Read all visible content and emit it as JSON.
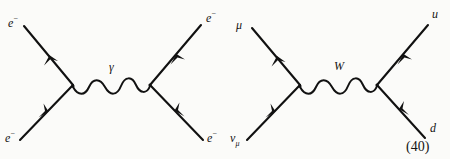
{
  "figure": {
    "caption_number": "(40)",
    "background_color": "#fbfbf9",
    "ink_color": "#111111",
    "width": 450,
    "height": 159
  },
  "diagrams": [
    {
      "id": "moller-scattering",
      "name": "electron-electron scattering",
      "propagator": {
        "label": "γ",
        "type": "photon",
        "style": "wavy"
      },
      "legs": [
        {
          "position": "top-left",
          "label_base": "e",
          "label_sup": "−",
          "direction": "outgoing"
        },
        {
          "position": "bottom-left",
          "label_base": "e",
          "label_sup": "−",
          "direction": "incoming"
        },
        {
          "position": "top-right",
          "label_base": "e",
          "label_sup": "−",
          "direction": "outgoing"
        },
        {
          "position": "bottom-right",
          "label_base": "e",
          "label_sup": "−",
          "direction": "incoming"
        }
      ]
    },
    {
      "id": "charged-current-weak",
      "name": "muon neutrino charged current to up down quarks",
      "propagator": {
        "label": "W",
        "type": "w-boson",
        "style": "wavy"
      },
      "legs": [
        {
          "position": "top-left",
          "label_base": "μ",
          "label_sup": "",
          "direction": "outgoing"
        },
        {
          "position": "bottom-left",
          "label_base": "ν",
          "label_sub": "μ",
          "direction": "incoming"
        },
        {
          "position": "top-right",
          "label_base": "u",
          "label_sup": "",
          "direction": "outgoing"
        },
        {
          "position": "bottom-right",
          "label_base": "d",
          "label_sup": "",
          "direction": "incoming"
        }
      ]
    }
  ],
  "labels": {
    "d1_top_left": {
      "base": "e",
      "sup": "−"
    },
    "d1_bottom_left": {
      "base": "e",
      "sup": "−"
    },
    "d1_top_right": {
      "base": "e",
      "sup": "−"
    },
    "d1_bottom_right": {
      "base": "e",
      "sup": "−"
    },
    "d1_propagator": "γ",
    "d2_top_left": {
      "base": "μ"
    },
    "d2_bottom_left": {
      "base": "ν",
      "sub": "μ"
    },
    "d2_top_right": {
      "base": "u"
    },
    "d2_bottom_right": {
      "base": "d"
    },
    "d2_propagator": "W",
    "equation_number": "(40)"
  }
}
